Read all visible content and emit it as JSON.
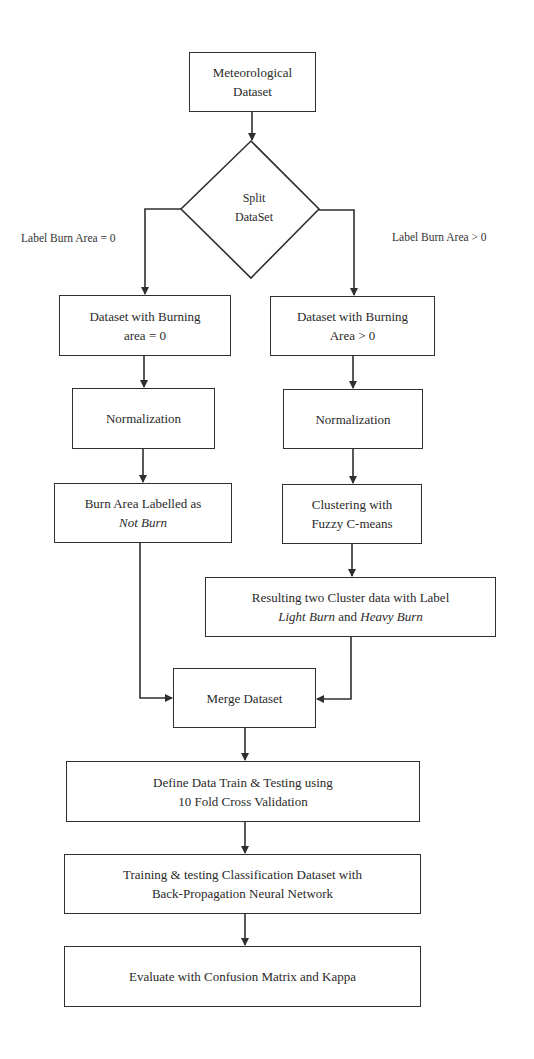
{
  "diagram": {
    "type": "flowchart",
    "nodes": {
      "start": {
        "line1": "Meteorological",
        "line2": "Dataset"
      },
      "split": {
        "line1": "Split",
        "line2": "DataSet"
      },
      "left_dataset": {
        "line1": "Dataset with Burning",
        "line2": "area = 0"
      },
      "right_dataset": {
        "line1": "Dataset with Burning",
        "line2": "Area > 0"
      },
      "left_norm": {
        "line1": "Normalization"
      },
      "right_norm": {
        "line1": "Normalization"
      },
      "left_label": {
        "line1": "Burn Area Labelled as",
        "line2": "Not Burn"
      },
      "clustering": {
        "line1": "Clustering with",
        "line2": "Fuzzy C-means"
      },
      "result_clusters": {
        "line1": "Resulting two Cluster data with Label",
        "line2_a": "Light Burn",
        "line2_b": " and ",
        "line2_c": "Heavy Burn"
      },
      "merge": {
        "line1": "Merge Dataset"
      },
      "define": {
        "line1": "Define Data Train & Testing using",
        "line2": "10 Fold Cross Validation"
      },
      "training": {
        "line1": "Training & testing Classification Dataset with",
        "line2": "Back-Propagation Neural Network"
      },
      "evaluate": {
        "line1": "Evaluate with Confusion Matrix and Kappa"
      }
    },
    "edge_labels": {
      "left": "Label Burn Area = 0",
      "right": "Label Burn Area > 0"
    },
    "colors": {
      "stroke": "#2f2f2f",
      "background": "#ffffff",
      "text": "#2a2a2a"
    }
  }
}
